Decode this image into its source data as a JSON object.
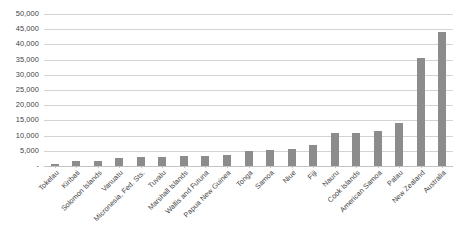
{
  "chart_data": {
    "type": "bar",
    "title": "",
    "xlabel": "",
    "ylabel": "",
    "ylim": [
      0,
      50000
    ],
    "ytick_step": 5000,
    "grid": true,
    "legend": "none",
    "bar_color": "#8c8c8c",
    "gridline_color": "#d3d3d3",
    "zero_tick_label": "-",
    "ytick_labels": [
      "50,000",
      "45,000",
      "40,000",
      "35,000",
      "30,000",
      "25,000",
      "20,000",
      "15,000",
      "10,000",
      "5,000",
      "-"
    ],
    "ytick_values": [
      50000,
      45000,
      40000,
      35000,
      30000,
      25000,
      20000,
      15000,
      10000,
      5000,
      0
    ],
    "categories": [
      "Tokelau",
      "Kiribati",
      "Solomon Islands",
      "Vanuatu",
      "Micronesia, Fed. Sts.",
      "Tuvalu",
      "Marshall Islands",
      "Wallis and Futuna",
      "Papua New Guinea",
      "Tonga",
      "Samoa",
      "Niue",
      "Fiji",
      "Nauru",
      "Cook Islands",
      "American Samoa",
      "Palau",
      "New Zealand",
      "Australia"
    ],
    "values": [
      600,
      1500,
      1700,
      2700,
      2900,
      3000,
      3400,
      3400,
      3600,
      4800,
      5300,
      5600,
      7000,
      11000,
      11000,
      11600,
      14000,
      35500,
      44000
    ]
  }
}
